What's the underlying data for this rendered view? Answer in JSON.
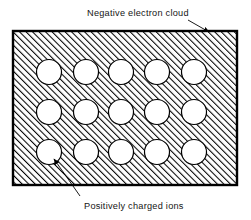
{
  "figure": {
    "background_color": "#ffffff",
    "line_color": "#000000",
    "width": 251,
    "height": 220
  },
  "lattice": {
    "name": "hatched-metal-block",
    "description": "Rectangular block with 45-degree diagonal hatching representing the negative electron cloud",
    "fill_pattern": "diagonal-hatch-45",
    "hatch_spacing_px": 4.6,
    "hatch_angle_deg": 45,
    "border_color": "#000000",
    "border_width_px": 2,
    "rect": {
      "x": 13,
      "y": 31,
      "width": 224,
      "height": 154
    },
    "ion_rows": 3,
    "ion_columns": 5,
    "ion_count": 15,
    "ion_radius_px": 12.5,
    "ion_fill_color": "#ffffff",
    "ion_stroke_color": "#000000",
    "ion_centers": [
      {
        "x": 49,
        "y": 72
      },
      {
        "x": 86,
        "y": 72
      },
      {
        "x": 121,
        "y": 72
      },
      {
        "x": 157,
        "y": 72
      },
      {
        "x": 194,
        "y": 72
      },
      {
        "x": 49,
        "y": 112
      },
      {
        "x": 86,
        "y": 112
      },
      {
        "x": 121,
        "y": 112
      },
      {
        "x": 157,
        "y": 112
      },
      {
        "x": 194,
        "y": 112
      },
      {
        "x": 49,
        "y": 152
      },
      {
        "x": 86,
        "y": 152
      },
      {
        "x": 121,
        "y": 152
      },
      {
        "x": 157,
        "y": 152
      },
      {
        "x": 194,
        "y": 152
      }
    ]
  },
  "annotations": {
    "top": {
      "text": "Negative electron cloud",
      "text_x": 87,
      "text_y": 16,
      "anchor": "start",
      "leader_from": {
        "x": 188,
        "y": 20
      },
      "leader_to": {
        "x": 210,
        "y": 33
      },
      "arrowhead": "filled-triangle"
    },
    "bottom": {
      "text": "Positively charged ions",
      "text_x": 84,
      "text_y": 208,
      "anchor": "start",
      "leader_from": {
        "x": 80,
        "y": 196
      },
      "leader_to": {
        "x": 53,
        "y": 158
      },
      "arrowhead": "filled-triangle"
    }
  }
}
